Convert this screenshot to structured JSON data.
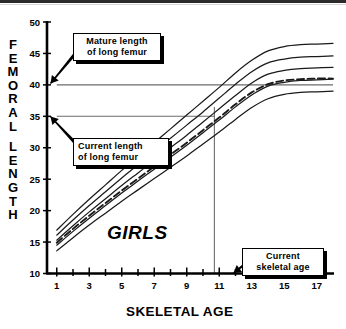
{
  "chart_data": {
    "type": "line",
    "title": "",
    "xlabel": "SKELETAL AGE",
    "ylabel": "FEMORAL LENGTH",
    "xlim": [
      0.4,
      18.0
    ],
    "ylim": [
      10,
      50
    ],
    "grid": false,
    "legend": null,
    "xticks_major": [
      1,
      3,
      5,
      7,
      9,
      11,
      13,
      15,
      17
    ],
    "xticks_all": [
      1,
      2,
      3,
      4,
      5,
      6,
      7,
      8,
      9,
      10,
      11,
      12,
      13,
      14,
      15,
      16,
      17
    ],
    "yticks": [
      10,
      15,
      20,
      25,
      30,
      35,
      40,
      45,
      50
    ],
    "annotation_text": "GIRLS",
    "x": [
      1,
      2,
      3,
      4,
      5,
      6,
      7,
      8,
      9,
      10,
      11,
      12,
      13,
      14,
      15,
      16,
      17,
      18
    ],
    "series": [
      {
        "name": "percentile-curve-1",
        "style": "solid",
        "values": [
          16.9,
          19.4,
          21.8,
          24.1,
          26.4,
          28.6,
          30.8,
          33.0,
          35.2,
          37.4,
          39.6,
          41.9,
          43.9,
          45.4,
          46.1,
          46.4,
          46.5,
          46.6
        ]
      },
      {
        "name": "percentile-curve-2",
        "style": "solid",
        "values": [
          16.1,
          18.5,
          20.8,
          23.0,
          25.2,
          27.3,
          29.4,
          31.5,
          33.6,
          35.7,
          37.9,
          40.1,
          42.1,
          43.5,
          44.1,
          44.4,
          44.5,
          44.6
        ]
      },
      {
        "name": "percentile-curve-3",
        "style": "solid",
        "values": [
          15.3,
          17.6,
          19.8,
          21.9,
          24.0,
          26.0,
          28.0,
          30.0,
          32.0,
          34.1,
          36.2,
          38.3,
          40.3,
          41.7,
          42.3,
          42.6,
          42.7,
          42.8
        ]
      },
      {
        "name": "percentile-curve-4",
        "style": "solid",
        "values": [
          14.5,
          16.7,
          18.8,
          20.8,
          22.8,
          24.7,
          26.6,
          28.5,
          30.4,
          32.4,
          34.4,
          36.5,
          38.4,
          39.8,
          40.4,
          40.7,
          40.8,
          40.9
        ]
      },
      {
        "name": "percentile-curve-5",
        "style": "solid",
        "values": [
          13.6,
          15.7,
          17.7,
          19.6,
          21.5,
          23.3,
          25.1,
          26.9,
          28.7,
          30.6,
          32.5,
          34.5,
          36.4,
          37.8,
          38.5,
          38.8,
          38.9,
          39.0
        ]
      },
      {
        "name": "patient-projection-curve",
        "style": "dashed",
        "values": [
          14.9,
          17.1,
          19.2,
          21.2,
          23.2,
          25.1,
          27.0,
          28.9,
          30.8,
          32.8,
          34.8,
          36.9,
          38.8,
          40.1,
          40.7,
          40.9,
          41.0,
          41.0
        ]
      }
    ],
    "reference_lines": [
      {
        "name": "mature-length-line",
        "orientation": "horizontal",
        "value": 40,
        "label": "Mature length of long femur",
        "x_from": 1.0,
        "x_to": 18.0
      },
      {
        "name": "current-length-line",
        "orientation": "horizontal",
        "value": 35,
        "label": "Current length of long femur",
        "x_from": 1.0,
        "x_to": 10.7
      },
      {
        "name": "current-skeletal-age-line",
        "orientation": "vertical",
        "value": 10.7,
        "label": "Current skeletal age",
        "y_from": 10,
        "y_to": 36.5
      }
    ]
  },
  "axes": {
    "y_title_letters": [
      "F",
      "E",
      "M",
      "O",
      "R",
      "A",
      "L",
      "",
      "L",
      "E",
      "N",
      "G",
      "T",
      "H"
    ],
    "y_tick_labels": [
      "50",
      "45",
      "40",
      "35",
      "30",
      "25",
      "20",
      "15",
      "10"
    ],
    "x_tick_labels": [
      "1",
      "3",
      "5",
      "7",
      "9",
      "11",
      "13",
      "15",
      "17"
    ],
    "x_title": "SKELETAL AGE"
  },
  "annotations": {
    "girls_label": "GIRLS",
    "mature_length": "Mature  length\nof long femur",
    "current_length": "Current  length\nof long femur",
    "current_skeletal_age": "Current\nskeletal  age"
  },
  "colors": {
    "axis": "#000000",
    "curve": "#1a1a1a",
    "reference_line": "#6b6b6b",
    "callout_border": "#000000",
    "callout_shadow": "#000000",
    "background": "#ffffff"
  }
}
